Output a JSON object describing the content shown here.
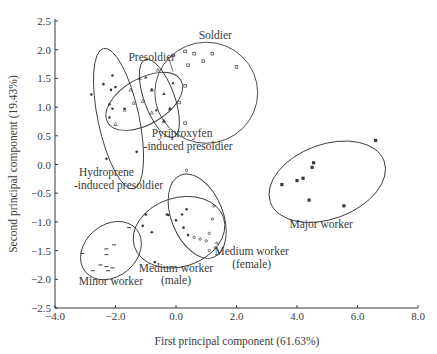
{
  "chart_data": {
    "type": "scatter",
    "title": "",
    "xlabel": "First principal component (61.63%)",
    "ylabel": "Second principal component (19.43%)",
    "xlim": [
      -4.0,
      8.0
    ],
    "ylim": [
      -2.5,
      2.5
    ],
    "xticks": [
      "-4.0",
      "-2.0",
      "0.0",
      "2.0",
      "4.0",
      "6.0",
      "8.0"
    ],
    "yticks": [
      "2.5",
      "2.0",
      "1.5",
      "1.0",
      "0.5",
      "0.0",
      "-0.5",
      "-1.0",
      "-1.5",
      "-2.0",
      "-2.5"
    ],
    "grid": false,
    "legend": "none (groups labeled inline next to ellipses)",
    "series": [
      {
        "name": "Soldier",
        "marker": "open-square",
        "points": [
          [
            -0.1,
            1.9
          ],
          [
            0.3,
            1.97
          ],
          [
            0.6,
            1.93
          ],
          [
            1.2,
            1.93
          ],
          [
            0.9,
            1.8
          ],
          [
            0.4,
            1.73
          ],
          [
            2.0,
            1.7
          ],
          [
            0.3,
            1.37
          ],
          [
            0.1,
            1.08
          ],
          [
            0.3,
            0.72
          ]
        ],
        "ellipse": {
          "cx": 1.0,
          "cy": 1.25,
          "rx": 1.7,
          "ry": 0.88,
          "angle": 0
        }
      },
      {
        "name": "Presoldier",
        "marker": "open-triangle",
        "points": [
          [
            -1.5,
            1.3
          ],
          [
            -1.2,
            1.5
          ],
          [
            -0.6,
            1.65
          ],
          [
            -0.8,
            1.3
          ],
          [
            -1.1,
            1.1
          ],
          [
            -1.4,
            1.07
          ],
          [
            -1.7,
            0.95
          ],
          [
            -0.8,
            0.9
          ],
          [
            -0.2,
            0.97
          ],
          [
            -0.4,
            0.75
          ],
          [
            -2.0,
            0.7
          ]
        ],
        "ellipse": {
          "cx": -1.05,
          "cy": 1.1,
          "rx": 1.4,
          "ry": 0.4,
          "angle": -30
        }
      },
      {
        "name": "Pyriproxyfen-induced presoldier",
        "marker": "filled-triangle",
        "points": [
          [
            -1.0,
            1.52
          ],
          [
            -0.8,
            1.3
          ],
          [
            -0.65,
            0.95
          ],
          [
            -0.4,
            1.23
          ],
          [
            -0.2,
            0.97
          ],
          [
            -0.4,
            0.76
          ],
          [
            -0.1,
            1.42
          ]
        ],
        "ellipse": {
          "cx": -0.55,
          "cy": 1.15,
          "rx": 0.5,
          "ry": 0.72,
          "angle": -20
        }
      },
      {
        "name": "Hydroprene-induced presoldier",
        "marker": "filled-circle",
        "points": [
          [
            -2.8,
            1.22
          ],
          [
            -2.4,
            1.4
          ],
          [
            -2.1,
            1.55
          ],
          [
            -2.15,
            1.3
          ],
          [
            -2.0,
            1.35
          ],
          [
            -2.2,
            1.05
          ],
          [
            -2.2,
            0.82
          ],
          [
            -2.1,
            0.97
          ],
          [
            -1.7,
            0.97
          ],
          [
            -1.3,
            0.22
          ],
          [
            -2.3,
            0.1
          ]
        ],
        "ellipse": {
          "cx": -1.9,
          "cy": 0.8,
          "rx": 0.68,
          "ry": 1.25,
          "angle": -12
        }
      },
      {
        "name": "Minor worker",
        "marker": "dash",
        "points": [
          [
            -3.1,
            -1.55
          ],
          [
            -2.75,
            -1.85
          ],
          [
            -2.5,
            -1.75
          ],
          [
            -2.3,
            -1.47
          ],
          [
            -2.3,
            -1.57
          ],
          [
            -2.05,
            -1.4
          ],
          [
            -2.3,
            -1.78
          ],
          [
            -2.1,
            -1.8
          ],
          [
            -2.25,
            -1.85
          ],
          [
            -1.55,
            -1.1
          ]
        ],
        "ellipse": {
          "cx": -2.15,
          "cy": -1.5,
          "rx": 1.1,
          "ry": 0.45,
          "angle": -40
        }
      },
      {
        "name": "Medium worker (male)",
        "marker": "filled-circle",
        "points": [
          [
            -1.0,
            -0.87
          ],
          [
            -1.1,
            -1.07
          ],
          [
            -0.8,
            -1.18
          ],
          [
            -0.3,
            -0.87
          ],
          [
            0.2,
            -0.87
          ],
          [
            0.35,
            -0.78
          ],
          [
            0.0,
            -0.97
          ],
          [
            0.25,
            -1.1
          ],
          [
            0.4,
            -1.23
          ],
          [
            -0.7,
            -1.7
          ],
          [
            -0.25,
            -0.88
          ]
        ],
        "ellipse": {
          "cx": 0.1,
          "cy": -1.18,
          "rx": 1.55,
          "ry": 0.6,
          "angle": -18
        }
      },
      {
        "name": "Medium worker (female)",
        "marker": "open-circle",
        "points": [
          [
            0.35,
            -0.1
          ],
          [
            1.25,
            -0.72
          ],
          [
            1.2,
            -0.95
          ],
          [
            1.1,
            -1.2
          ],
          [
            0.8,
            -1.3
          ],
          [
            1.0,
            -1.33
          ],
          [
            1.35,
            -1.37
          ],
          [
            1.1,
            -1.5
          ],
          [
            1.3,
            -1.45
          ],
          [
            0.6,
            -1.27
          ]
        ],
        "ellipse": {
          "cx": 0.7,
          "cy": -0.9,
          "rx": 0.85,
          "ry": 0.77,
          "angle": -22
        }
      },
      {
        "name": "Major worker",
        "marker": "filled-square",
        "points": [
          [
            3.5,
            -0.35
          ],
          [
            4.0,
            -0.28
          ],
          [
            4.2,
            -0.24
          ],
          [
            4.5,
            -0.05
          ],
          [
            4.55,
            0.03
          ],
          [
            4.4,
            -0.62
          ],
          [
            5.55,
            -0.72
          ],
          [
            6.6,
            0.42
          ]
        ],
        "ellipse": {
          "cx": 5.0,
          "cy": -0.3,
          "rx": 2.0,
          "ry": 0.65,
          "angle": -20
        }
      }
    ],
    "annotations": [
      {
        "text": "Soldier",
        "x": 1.3,
        "y": 2.18
      },
      {
        "text": "Presoldier",
        "x": -0.8,
        "y": 1.8
      },
      {
        "text": "Pyriproxyfen",
        "x": 0.2,
        "y": 0.48
      },
      {
        "text": "-induced presoldier",
        "x": 0.4,
        "y": 0.26
      },
      {
        "text": "Hydroprene",
        "x": -2.3,
        "y": -0.2
      },
      {
        "text": "-induced presoldier",
        "x": -1.9,
        "y": -0.42
      },
      {
        "text": "Medium worker",
        "x": 2.5,
        "y": -1.58
      },
      {
        "text": "(female)",
        "x": 2.5,
        "y": -1.8
      },
      {
        "text": "Major worker",
        "x": 4.8,
        "y": -1.1
      },
      {
        "text": "Medium worker",
        "x": 0.0,
        "y": -1.87
      },
      {
        "text": "(male)",
        "x": 0.0,
        "y": -2.09
      },
      {
        "text": "Minor worker",
        "x": -2.15,
        "y": -2.1
      }
    ],
    "colors": {
      "ink": "#3a3a3a",
      "background": "#ffffff"
    }
  }
}
